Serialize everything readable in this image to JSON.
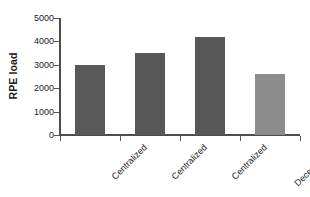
{
  "chart_data": {
    "type": "bar",
    "title": "",
    "xlabel": "",
    "ylabel": "RPE load",
    "categories": [
      "Centralized",
      "Centralized",
      "Centralized",
      "Decentralized"
    ],
    "values": [
      3000,
      3500,
      4200,
      2600
    ],
    "ylim": [
      0,
      5000
    ],
    "yticks": [
      0,
      1000,
      2000,
      3000,
      4000,
      5000
    ],
    "ytick_labels": [
      "0",
      "1000",
      "2000",
      "3000",
      "4000",
      "5000"
    ],
    "grid": false,
    "legend": "none",
    "bar_colors": [
      "#595959",
      "#585858",
      "#575757",
      "#8c8c8c"
    ],
    "axis_color": "#4d4d4d",
    "background_color": "#ffffff",
    "xtick_label_rotation": -45
  }
}
